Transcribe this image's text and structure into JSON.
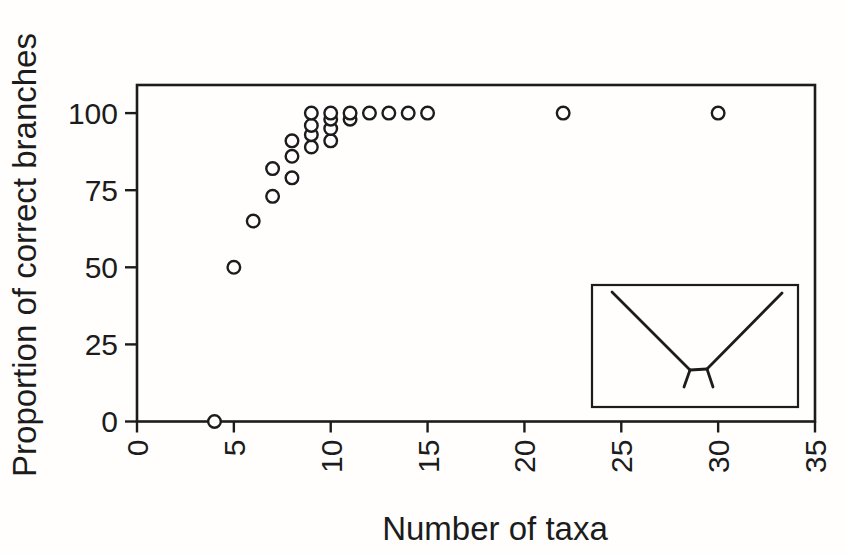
{
  "chart_data": {
    "type": "scatter",
    "title": "",
    "xlabel": "Number of taxa",
    "ylabel": "Proportion of correct branches",
    "xlim": [
      0,
      35
    ],
    "ylim": [
      0,
      109
    ],
    "x_ticks": [
      0,
      5,
      10,
      15,
      20,
      25,
      30,
      35
    ],
    "y_ticks": [
      0,
      25,
      50,
      75,
      100
    ],
    "x_tick_label_rotation_deg": -90,
    "grid": false,
    "legend": "none",
    "marker": "open-circle",
    "marker_color": "#1c1c1c",
    "points": [
      [
        4,
        0
      ],
      [
        5,
        50
      ],
      [
        6,
        65
      ],
      [
        7,
        73
      ],
      [
        7,
        82
      ],
      [
        8,
        79
      ],
      [
        8,
        86
      ],
      [
        8,
        91
      ],
      [
        9,
        89
      ],
      [
        9,
        93
      ],
      [
        9,
        96
      ],
      [
        9,
        100
      ],
      [
        10,
        91
      ],
      [
        10,
        95
      ],
      [
        10,
        98
      ],
      [
        10,
        100
      ],
      [
        11,
        98
      ],
      [
        11,
        100
      ],
      [
        12,
        100
      ],
      [
        13,
        100
      ],
      [
        14,
        100
      ],
      [
        15,
        100
      ],
      [
        22,
        100
      ],
      [
        30,
        100
      ]
    ],
    "inset": {
      "position": "lower-right-inside-plot",
      "content": "unrooted four-taxon tree icon with two long branches and two short branches (long-branch-attraction tree)"
    }
  },
  "colors": {
    "ink": "#1c1c1c",
    "background": "#ffffff"
  }
}
